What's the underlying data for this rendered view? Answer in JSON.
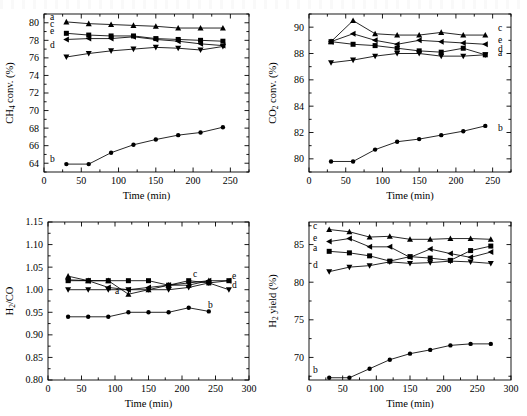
{
  "figure": {
    "title": "",
    "panel_count": 4,
    "x_axis_label": "Time (min)",
    "marker_shapes": {
      "a": "triangle-up",
      "b": "circle",
      "c": "square",
      "d": "triangle-down",
      "e": "triangle-left"
    },
    "line_color": "#000000"
  },
  "chart_data": [
    {
      "type": "line",
      "panel": "top-left",
      "title": "",
      "xlabel": "Time (min)",
      "ylabel": "CH4 conv. (%)",
      "ylabel_parts": [
        "CH",
        "4",
        " conv. (%)"
      ],
      "xlim": [
        0,
        275
      ],
      "ylim": [
        63,
        81
      ],
      "xticks": [
        0,
        50,
        100,
        150,
        200,
        250
      ],
      "yticks": [
        64,
        66,
        68,
        70,
        72,
        74,
        76,
        78,
        80
      ],
      "minor_ticks": true,
      "grid": false,
      "legend": "inline-labels",
      "x": [
        30,
        60,
        90,
        120,
        150,
        180,
        210,
        240
      ],
      "series": [
        {
          "name": "a",
          "marker": "triangle-up",
          "label_pos": "left",
          "values": [
            80.1,
            79.9,
            79.8,
            79.7,
            79.6,
            79.4,
            79.4,
            79.4
          ]
        },
        {
          "name": "b",
          "marker": "circle",
          "label_pos": "left",
          "values": [
            63.9,
            63.9,
            65.2,
            66.1,
            66.7,
            67.2,
            67.5,
            68.1
          ]
        },
        {
          "name": "c",
          "marker": "square",
          "label_pos": "left",
          "values": [
            78.8,
            78.6,
            78.5,
            78.5,
            78.2,
            78.1,
            78.0,
            77.9
          ]
        },
        {
          "name": "d",
          "marker": "triangle-down",
          "label_pos": "left",
          "values": [
            76.1,
            76.5,
            76.8,
            77.0,
            77.2,
            77.1,
            76.9,
            77.3
          ]
        },
        {
          "name": "e",
          "marker": "triangle-left",
          "label_pos": "left",
          "values": [
            78.1,
            78.2,
            78.2,
            78.4,
            78.1,
            77.9,
            77.6,
            77.4
          ]
        }
      ]
    },
    {
      "type": "line",
      "panel": "top-right",
      "title": "",
      "xlabel": "Time (min)",
      "ylabel": "CO2 conv. (%)",
      "ylabel_parts": [
        "CO",
        "2",
        " conv. (%)"
      ],
      "xlim": [
        0,
        275
      ],
      "ylim": [
        79,
        91
      ],
      "xticks": [
        0,
        50,
        100,
        150,
        200,
        250
      ],
      "yticks": [
        80,
        82,
        84,
        86,
        88,
        90
      ],
      "minor_ticks": true,
      "grid": false,
      "legend": "inline-labels",
      "x": [
        30,
        60,
        90,
        120,
        150,
        180,
        210,
        240
      ],
      "series": [
        {
          "name": "a",
          "marker": "triangle-up",
          "label_pos": "right",
          "values": [
            88.9,
            90.5,
            89.5,
            89.4,
            89.4,
            89.6,
            89.4,
            89.4
          ]
        },
        {
          "name": "b",
          "marker": "circle",
          "label_pos": "right",
          "values": [
            79.8,
            79.8,
            80.7,
            81.3,
            81.5,
            81.8,
            82.1,
            82.5
          ]
        },
        {
          "name": "c",
          "marker": "square",
          "label_pos": "right",
          "values": [
            88.9,
            88.7,
            88.6,
            88.4,
            88.2,
            88.1,
            88.4,
            87.9
          ]
        },
        {
          "name": "d",
          "marker": "triangle-down",
          "label_pos": "right",
          "values": [
            87.3,
            87.5,
            87.8,
            88.0,
            88.0,
            87.8,
            87.8,
            87.9
          ]
        },
        {
          "name": "e",
          "marker": "triangle-left",
          "label_pos": "right",
          "values": [
            88.9,
            89.5,
            89.0,
            88.7,
            89.0,
            88.9,
            88.8,
            88.7
          ]
        }
      ]
    },
    {
      "type": "line",
      "panel": "bottom-left",
      "title": "",
      "xlabel": "Time (min)",
      "ylabel": "H2/CO",
      "ylabel_parts": [
        "H",
        "2",
        "/CO"
      ],
      "xlim": [
        0,
        300
      ],
      "ylim": [
        0.8,
        1.15
      ],
      "xticks": [
        0,
        50,
        100,
        150,
        200,
        250,
        300
      ],
      "yticks": [
        0.8,
        0.85,
        0.9,
        0.95,
        1.0,
        1.05,
        1.1,
        1.15
      ],
      "ytick_labels": [
        "0.80",
        "0.85",
        "0.90",
        "0.95",
        "1.00",
        "1.05",
        "1.10",
        "1.15"
      ],
      "minor_ticks": true,
      "grid": false,
      "legend": "inline-labels",
      "x": [
        30,
        60,
        90,
        120,
        150,
        180,
        210,
        240,
        270
      ],
      "series": [
        {
          "name": "a",
          "marker": "triangle-up",
          "label_pos": "inline",
          "values": [
            1.03,
            1.02,
            1.02,
            0.99,
            1.0,
            1.01,
            1.01,
            1.02,
            null
          ]
        },
        {
          "name": "b",
          "marker": "circle",
          "label_pos": "right",
          "values": [
            0.94,
            0.94,
            0.94,
            0.95,
            0.95,
            0.95,
            0.96,
            0.952,
            null
          ]
        },
        {
          "name": "c",
          "marker": "square",
          "label_pos": "right",
          "values": [
            1.02,
            1.02,
            1.02,
            1.02,
            1.02,
            1.01,
            1.02,
            1.015,
            1.02
          ]
        },
        {
          "name": "d",
          "marker": "triangle-down",
          "label_pos": "right",
          "values": [
            1.0,
            1.0,
            1.0,
            1.0,
            1.0,
            1.0,
            1.005,
            1.015,
            1.0
          ]
        },
        {
          "name": "e",
          "marker": "triangle-left",
          "label_pos": "right",
          "values": [
            1.022,
            1.02,
            1.005,
            1.0,
            1.005,
            1.01,
            1.015,
            1.02,
            1.02
          ]
        }
      ]
    },
    {
      "type": "line",
      "panel": "bottom-right",
      "title": "",
      "xlabel": "Time (min)",
      "ylabel": "H2 yield (%)",
      "ylabel_parts": [
        "H",
        "2",
        " yield (%)"
      ],
      "xlim": [
        0,
        300
      ],
      "ylim": [
        67,
        88
      ],
      "xticks": [
        0,
        50,
        100,
        150,
        200,
        250,
        300
      ],
      "yticks": [
        70,
        75,
        80,
        85
      ],
      "minor_ticks": true,
      "grid": false,
      "legend": "inline-labels",
      "x": [
        30,
        60,
        90,
        120,
        150,
        180,
        210,
        240,
        270
      ],
      "series": [
        {
          "name": "a",
          "marker": "square",
          "label_pos": "left",
          "values": [
            84.1,
            83.9,
            83.5,
            82.8,
            83.4,
            83.2,
            82.9,
            84.2,
            84.8
          ]
        },
        {
          "name": "b",
          "marker": "circle",
          "label_pos": "left",
          "values": [
            67.3,
            67.3,
            68.5,
            69.7,
            70.5,
            71.0,
            71.6,
            71.8,
            71.8
          ]
        },
        {
          "name": "c",
          "marker": "triangle-up",
          "label_pos": "left",
          "values": [
            87.0,
            86.7,
            86.0,
            86.1,
            85.7,
            85.7,
            85.8,
            85.8,
            85.7
          ]
        },
        {
          "name": "d",
          "marker": "triangle-down",
          "label_pos": "left",
          "values": [
            81.4,
            82.0,
            82.2,
            82.7,
            82.5,
            82.6,
            82.8,
            82.7,
            82.5
          ]
        },
        {
          "name": "e",
          "marker": "triangle-left",
          "label_pos": "left",
          "values": [
            85.4,
            85.8,
            84.7,
            84.7,
            83.3,
            84.4,
            83.8,
            83.3,
            84.0
          ]
        }
      ]
    }
  ]
}
